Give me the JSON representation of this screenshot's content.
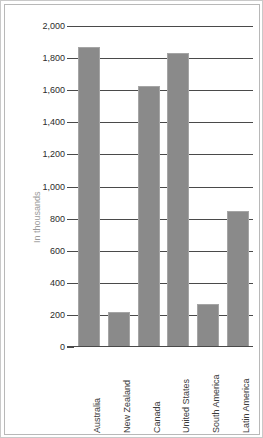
{
  "chart_data": {
    "type": "bar",
    "title": "",
    "xlabel": "",
    "ylabel": "In thousands",
    "ylim": [
      0,
      2000
    ],
    "grid": true,
    "legend": "none",
    "orientation": "vertical",
    "bar_color": "#8a8a8a",
    "categories": [
      "Australia",
      "New Zealand",
      "Canada",
      "United States",
      "South America",
      "Latin America"
    ],
    "values": [
      1870,
      220,
      1625,
      1830,
      270,
      845
    ],
    "ytick_values": [
      0,
      200,
      400,
      600,
      800,
      1000,
      1200,
      1400,
      1600,
      1800,
      2000
    ],
    "ytick_labels": [
      "0",
      "200",
      "400",
      "600",
      "800",
      "1,000",
      "1,200",
      "1,400",
      "1,600",
      "1,800",
      "2,000"
    ]
  },
  "colors": {
    "bar": "#8a8a8a",
    "bar_outline": "#a5a5a5",
    "gridline": "#4a4a4a",
    "axis_title": "#9a9a9a",
    "tick_label": "#2b2b2b",
    "category_label": "#3a3a3a",
    "frame_border": "#b8b8b8",
    "background": "#ffffff"
  }
}
